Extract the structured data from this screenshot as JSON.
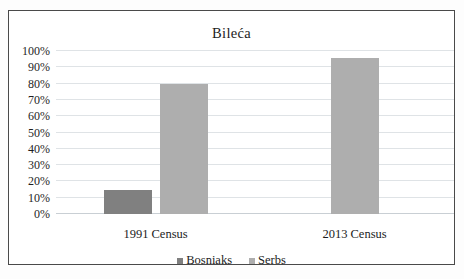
{
  "chart_data": {
    "type": "bar",
    "title": "Bileća",
    "xlabel": "",
    "ylabel": "",
    "categories": [
      "1991 Census",
      "2013 Census"
    ],
    "series": [
      {
        "name": "Bosniaks",
        "color": "#808080",
        "values": [
          15,
          null
        ]
      },
      {
        "name": "Serbs",
        "color": "#aeaeae",
        "values": [
          80,
          96
        ]
      }
    ],
    "ylim": [
      0,
      100
    ],
    "ytick_labels": [
      "100%",
      "90%",
      "80%",
      "70%",
      "60%",
      "50%",
      "40%",
      "30%",
      "20%",
      "10%",
      "0%"
    ],
    "ytick_values": [
      100,
      90,
      80,
      70,
      60,
      50,
      40,
      30,
      20,
      10,
      0
    ],
    "grid": true,
    "legend_position": "bottom",
    "value_suffix": "%"
  },
  "legend": {
    "items": [
      {
        "label": "Bosniaks",
        "color": "#808080"
      },
      {
        "label": "Serbs",
        "color": "#aeaeae"
      }
    ]
  },
  "colors": {
    "bosniaks": "#808080",
    "serbs": "#aeaeae",
    "gridline": "#dfe3e6",
    "frame": "#4a4a4a",
    "text": "#1c1c1c"
  }
}
